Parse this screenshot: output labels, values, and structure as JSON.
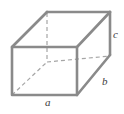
{
  "figure": {
    "type": "rectangular-prism-diagram",
    "background_color": "#ffffff",
    "edge_color": "#8a8a8a",
    "hidden_edge_color": "#a6a6a6",
    "label_color": "#3d3d3d",
    "labels": {
      "length": "a",
      "depth": "b",
      "height": "c"
    },
    "geometry": {
      "front_face": {
        "top_left": [
          12,
          47
        ],
        "top_right": [
          77,
          47
        ],
        "bottom_right": [
          77,
          95
        ],
        "bottom_left": [
          12,
          95
        ]
      },
      "back_face": {
        "top_left": [
          47,
          12
        ],
        "top_right": [
          110,
          12
        ],
        "bottom_right": [
          110,
          55
        ],
        "bottom_left": [
          47,
          62
        ]
      },
      "hidden_vertex": [
        47,
        62
      ],
      "visible_edges": [
        "front-top",
        "front-right",
        "front-bottom",
        "front-left",
        "back-top",
        "back-top-right",
        "back-right-vertical",
        "top-left-diagonal",
        "top-right-diagonal",
        "bottom-right-diagonal"
      ],
      "hidden_edges": [
        "back-left-vertical",
        "back-bottom-horizontal",
        "bottom-left-diagonal"
      ]
    }
  }
}
